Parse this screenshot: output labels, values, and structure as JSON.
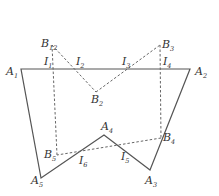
{
  "diagram": {
    "solid_polygon": [
      "A1",
      "A2",
      "A3",
      "A4",
      "A5"
    ],
    "dashed_polygon": [
      "B12",
      "B2",
      "B3",
      "B4",
      "B5"
    ],
    "points": {
      "A1": {
        "letter": "A",
        "sub": "1",
        "x": 21,
        "y": 69
      },
      "A2": {
        "letter": "A",
        "sub": "2",
        "x": 190,
        "y": 69
      },
      "A3": {
        "letter": "A",
        "sub": "3",
        "x": 150,
        "y": 170
      },
      "A4": {
        "letter": "A",
        "sub": "4",
        "x": 104,
        "y": 135
      },
      "A5": {
        "letter": "A",
        "sub": "5",
        "x": 41,
        "y": 178
      },
      "B12": {
        "letter": "B",
        "sub": "12",
        "x": 52,
        "y": 45
      },
      "B2": {
        "letter": "B",
        "sub": "2",
        "x": 96,
        "y": 92
      },
      "B3": {
        "letter": "B",
        "sub": "3",
        "x": 160,
        "y": 45
      },
      "B4": {
        "letter": "B",
        "sub": "4",
        "x": 161,
        "y": 138
      },
      "B5": {
        "letter": "B",
        "sub": "5",
        "x": 57,
        "y": 155
      },
      "I1": {
        "letter": "I",
        "sub": "1",
        "x": 52,
        "y": 69
      },
      "I2": {
        "letter": "I",
        "sub": "2",
        "x": 74,
        "y": 69
      },
      "I3": {
        "letter": "I",
        "sub": "3",
        "x": 119,
        "y": 69
      },
      "I4": {
        "letter": "I",
        "sub": "4",
        "x": 160,
        "y": 69
      },
      "I5": {
        "letter": "I",
        "sub": "5",
        "x": 125,
        "y": 150
      },
      "I6": {
        "letter": "I",
        "sub": "6",
        "x": 80,
        "y": 154
      }
    },
    "labels": {
      "A1": {
        "letter": "A",
        "sub": "1"
      },
      "A2": {
        "letter": "A",
        "sub": "2"
      },
      "A3": {
        "letter": "A",
        "sub": "3"
      },
      "A4": {
        "letter": "A",
        "sub": "4"
      },
      "A5": {
        "letter": "A",
        "sub": "5"
      },
      "B12": {
        "letter": "B",
        "sub": "12"
      },
      "B2": {
        "letter": "B",
        "sub": "2"
      },
      "B3": {
        "letter": "B",
        "sub": "3"
      },
      "B4": {
        "letter": "B",
        "sub": "4"
      },
      "B5": {
        "letter": "B",
        "sub": "5"
      },
      "I1": {
        "letter": "I",
        "sub": "1"
      },
      "I2": {
        "letter": "I",
        "sub": "2"
      },
      "I3": {
        "letter": "I",
        "sub": "3"
      },
      "I4": {
        "letter": "I",
        "sub": "4"
      },
      "I5": {
        "letter": "I",
        "sub": "5"
      },
      "I6": {
        "letter": "I",
        "sub": "6"
      }
    }
  }
}
